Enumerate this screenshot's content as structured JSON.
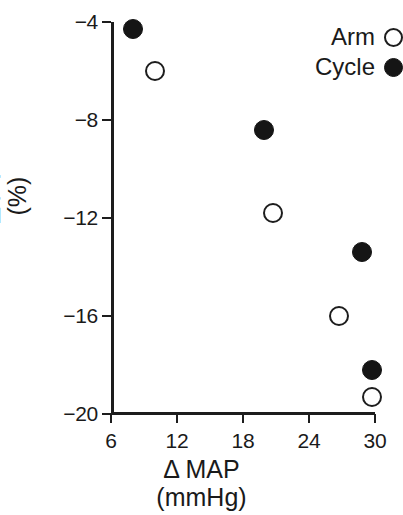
{
  "chart_data": {
    "type": "scatter",
    "title": "",
    "subtitle": "",
    "xlabel": "Δ MAP",
    "xlabel_units": "(mmHg)",
    "ylabel": "Δ PV",
    "ylabel_units": "(%)",
    "xlim": [
      6,
      30
    ],
    "ylim": [
      -20,
      -4
    ],
    "xticks": [
      6,
      12,
      18,
      24,
      30
    ],
    "yticks": [
      -4,
      -8,
      -12,
      -16,
      -20
    ],
    "xtick_labels": [
      "6",
      "12",
      "18",
      "24",
      "30"
    ],
    "ytick_labels": [
      "-4",
      "-8",
      "-12",
      "-16",
      "-20"
    ],
    "grid": false,
    "legend_position": "top-right",
    "marker_colors": {
      "arm": "#ffffff",
      "cycle": "#151515",
      "outline": "#1d1d1d"
    },
    "series": [
      {
        "name": "Arm",
        "marker": "open-circle",
        "points": [
          {
            "x": 10.0,
            "y": -6.0
          },
          {
            "x": 20.7,
            "y": -11.8
          },
          {
            "x": 26.7,
            "y": -16.0
          },
          {
            "x": 29.7,
            "y": -19.3
          }
        ]
      },
      {
        "name": "Cycle",
        "marker": "filled-circle",
        "points": [
          {
            "x": 8.0,
            "y": -4.3
          },
          {
            "x": 19.9,
            "y": -8.4
          },
          {
            "x": 28.8,
            "y": -13.4
          },
          {
            "x": 29.7,
            "y": -18.2
          }
        ]
      }
    ]
  },
  "legend": {
    "entries": [
      {
        "label": "Arm",
        "marker": "open-circle"
      },
      {
        "label": "Cycle",
        "marker": "filled-circle"
      }
    ]
  }
}
